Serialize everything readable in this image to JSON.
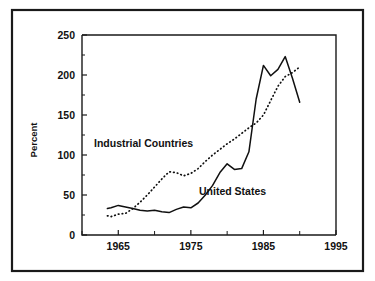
{
  "figure": {
    "background_color": "#ffffff",
    "frame_color": "#1a1a1a",
    "line_color": "#101010"
  },
  "annotations": {
    "industrial_label": "Industrial Countries",
    "united_states_label": "United States"
  },
  "chart_data": {
    "type": "line",
    "title": "",
    "subtitle": "",
    "xlabel": "",
    "ylabel": "Percent",
    "xlim": [
      1960,
      1995
    ],
    "ylim": [
      0,
      250
    ],
    "grid": false,
    "legend_position": "inline-annotation",
    "x_ticks": [
      1960,
      1965,
      1970,
      1975,
      1980,
      1985,
      1990,
      1995
    ],
    "x_tick_labels": [
      "",
      "1965",
      "",
      "1975",
      "",
      "1985",
      "",
      "1995"
    ],
    "x_minor_interval": 5,
    "y_ticks": [
      0,
      50,
      100,
      150,
      200,
      250
    ],
    "y_tick_labels": [
      "0",
      "50",
      "100",
      "150",
      "200",
      "250"
    ],
    "y_minor_ticks": [
      25,
      75,
      125,
      175,
      225
    ],
    "series": [
      {
        "name": "United States",
        "style": "solid",
        "x": [
          1963.5,
          1964,
          1965,
          1966,
          1967,
          1968,
          1969,
          1970,
          1971,
          1972,
          1973,
          1974,
          1975,
          1976,
          1977,
          1978,
          1979,
          1980,
          1981,
          1982,
          1983,
          1984,
          1985,
          1986,
          1987,
          1988,
          1989,
          1990
        ],
        "values": [
          33,
          34,
          37,
          35,
          33,
          31,
          30,
          31,
          29,
          28,
          32,
          35,
          34,
          40,
          50,
          62,
          78,
          89,
          82,
          83,
          104,
          170,
          212,
          199,
          207,
          223,
          196,
          166
        ]
      },
      {
        "name": "Industrial Countries",
        "style": "dotted",
        "x": [
          1963.5,
          1964,
          1965,
          1966,
          1967,
          1968,
          1969,
          1970,
          1971,
          1972,
          1973,
          1974,
          1975,
          1976,
          1977,
          1978,
          1979,
          1980,
          1981,
          1982,
          1983,
          1984,
          1985,
          1986,
          1987,
          1988,
          1989,
          1990
        ],
        "values": [
          24,
          23,
          26,
          27,
          33,
          41,
          50,
          60,
          70,
          79,
          78,
          74,
          77,
          83,
          92,
          100,
          107,
          114,
          120,
          127,
          134,
          140,
          150,
          168,
          186,
          198,
          203,
          210
        ]
      }
    ]
  }
}
